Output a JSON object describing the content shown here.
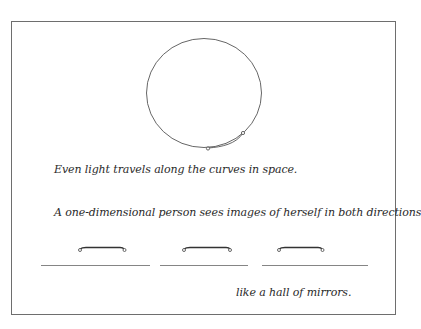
{
  "diagram": {
    "captions": {
      "curved_light": "Even light travels along the curves in space.",
      "one_dimensional": "A one-dimensional person sees images of herself in both directions",
      "mirrors": "like a hall of mirrors."
    },
    "figures": {
      "circle_space": {
        "shape": "circle",
        "description": "closed curved space with a small figure and light path"
      },
      "line_segments": {
        "count": 3,
        "description": "one-dimensional person repeated along a line"
      }
    },
    "colors": {
      "stroke": "#555555",
      "frame": "#6e6e6e",
      "text": "#2a2a2a"
    }
  }
}
